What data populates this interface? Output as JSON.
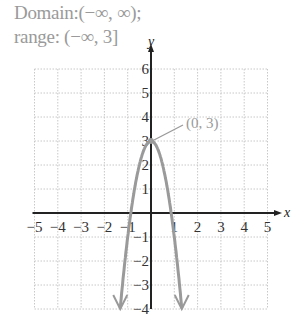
{
  "caption": {
    "domain_text": "Domain:(−∞, ∞);",
    "range_text": "range: (−∞, 3]"
  },
  "chart_data": {
    "type": "line",
    "title": "",
    "xlabel": "x",
    "ylabel": "y",
    "xlim": [
      -5,
      5
    ],
    "ylim": [
      -4,
      6
    ],
    "grid": true,
    "x_ticks": [
      "−5",
      "−4",
      "−3",
      "−2",
      "−1",
      "1",
      "2",
      "3",
      "4",
      "5"
    ],
    "y_ticks": [
      "6",
      "5",
      "4",
      "3",
      "2",
      "1",
      "−1",
      "−2",
      "−3",
      "−4"
    ],
    "series": [
      {
        "name": "parabola y = -4x^2 + 3",
        "color": "#9a9a9a",
        "x": [
          -1.32,
          -1.0,
          -0.75,
          -0.5,
          -0.25,
          0,
          0.25,
          0.5,
          0.75,
          1.0,
          1.32
        ],
        "y": [
          -4,
          -1,
          0.75,
          2,
          2.75,
          3,
          2.75,
          2,
          0.75,
          -1,
          -4
        ],
        "arrows_at_ends": true
      }
    ],
    "annotations": [
      {
        "text": "(0, 3)",
        "point": [
          0,
          3
        ]
      }
    ]
  },
  "axes": {
    "x_label": "x",
    "y_label": "y"
  },
  "annotation": {
    "vertex_label": "(0, 3)"
  },
  "colors": {
    "curve": "#9a9a9a",
    "grid": "#c8c8c8",
    "axis": "#222222",
    "caption": "#9a9a9a"
  }
}
